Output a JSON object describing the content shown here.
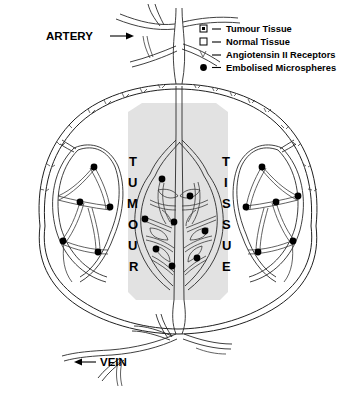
{
  "diagram": {
    "vessel_labels": {
      "artery": {
        "text": "ARTERY",
        "arrow": "→",
        "arrow_direction": "right"
      },
      "vein": {
        "text": "VEIN",
        "arrow": "←",
        "arrow_direction": "left"
      }
    },
    "tumour_block": {
      "left_word": "TUMOUR",
      "right_word": "TISSUE",
      "left_letters": [
        "T",
        "U",
        "M",
        "O",
        "U",
        "R"
      ],
      "right_letters": [
        "T",
        "I",
        "S",
        "S",
        "U",
        "E"
      ],
      "shade_color": "#e2e2e2"
    },
    "legend": {
      "items": [
        {
          "symbol": "filled-square-small",
          "dash": "—",
          "label": "Tumour Tissue"
        },
        {
          "symbol": "open-square",
          "dash": "—",
          "label": "Normal Tissue"
        },
        {
          "symbol": "receptor-tick",
          "dash": "—",
          "label": "Angiotensin II Receptors"
        },
        {
          "symbol": "filled-circle",
          "dash": "—",
          "label": "Embolised Microspheres"
        }
      ]
    },
    "colors": {
      "ink": "#000000",
      "vessel_stroke": "#2a2a2a",
      "tumour_shade": "#e2e2e2",
      "background": "#ffffff"
    },
    "counts": {
      "microspheres_total": 24,
      "tumour_region_spheres": 8,
      "left_normal_spheres": 5,
      "right_normal_spheres": 6
    }
  }
}
